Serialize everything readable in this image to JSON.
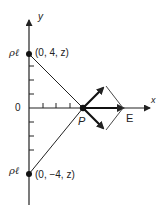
{
  "diagram": {
    "axes": {
      "x_label": "x",
      "y_label": "y",
      "origin_label": "0"
    },
    "charges": [
      {
        "symbol": "ρℓ",
        "coords": "(0, 4, z)"
      },
      {
        "symbol": "ρℓ",
        "coords": "(0, −4, z)"
      }
    ],
    "point": {
      "label": "P"
    },
    "field": {
      "label": "E"
    },
    "colors": {
      "line": "#222222",
      "background": "#ffffff"
    }
  }
}
